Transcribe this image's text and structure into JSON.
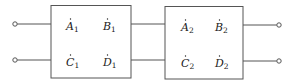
{
  "diagram": {
    "type": "cascaded two-port networks",
    "networks": [
      {
        "id": "network-1",
        "params": [
          {
            "letter": "A",
            "sub": "1",
            "dot": true
          },
          {
            "letter": "B",
            "sub": "1",
            "dot": true
          },
          {
            "letter": "C",
            "sub": "1",
            "dot": true
          },
          {
            "letter": "D",
            "sub": "1",
            "dot": true
          }
        ]
      },
      {
        "id": "network-2",
        "params": [
          {
            "letter": "A",
            "sub": "2",
            "dot": true
          },
          {
            "letter": "B",
            "sub": "2",
            "dot": true
          },
          {
            "letter": "C",
            "sub": "2",
            "dot": true
          },
          {
            "letter": "D",
            "sub": "2",
            "dot": true
          }
        ]
      }
    ],
    "terminals": {
      "input": 2,
      "output": 2
    },
    "colors": {
      "stroke": "#555555",
      "text": "#222222"
    }
  }
}
